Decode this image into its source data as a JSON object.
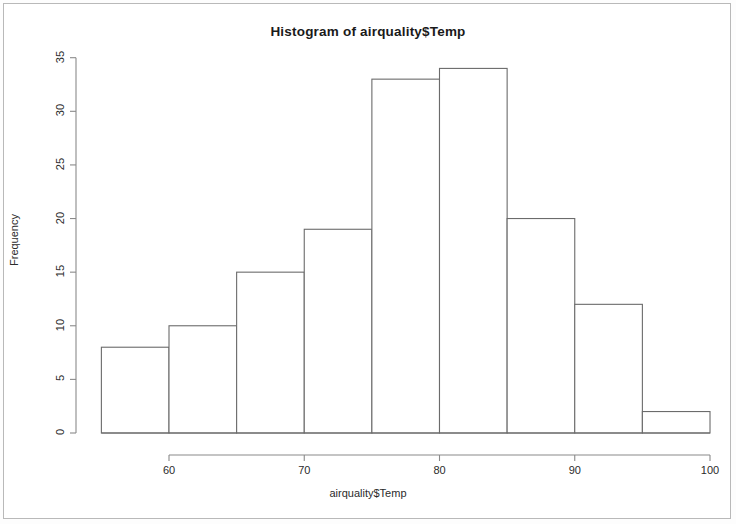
{
  "chart_data": {
    "type": "bar",
    "title": "Histogram of airquality$Temp",
    "xlabel": "airquality$Temp",
    "ylabel": "Frequency",
    "grid": false,
    "legend": null,
    "xlim": [
      55,
      100
    ],
    "ylim": [
      0,
      35
    ],
    "x_ticks": [
      "60",
      "70",
      "80",
      "90",
      "100"
    ],
    "x_tick_values": [
      60,
      70,
      80,
      90,
      100
    ],
    "y_ticks": [
      "0",
      "5",
      "10",
      "15",
      "20",
      "25",
      "30",
      "35"
    ],
    "y_tick_values": [
      0,
      5,
      10,
      15,
      20,
      25,
      30,
      35
    ],
    "bin_width": 5,
    "bin_edges": [
      55,
      60,
      65,
      70,
      75,
      80,
      85,
      90,
      95,
      100
    ],
    "categories": [
      "55-60",
      "60-65",
      "65-70",
      "70-75",
      "75-80",
      "80-85",
      "85-90",
      "90-95",
      "95-100"
    ],
    "values": [
      8,
      10,
      15,
      19,
      33,
      34,
      20,
      12,
      2
    ],
    "bar_fill": "#ffffff",
    "bar_stroke": "#6b6b6b",
    "axis_color": "#8a8a8a",
    "text_color": "#2b2b2b",
    "background": "#ffffff"
  }
}
